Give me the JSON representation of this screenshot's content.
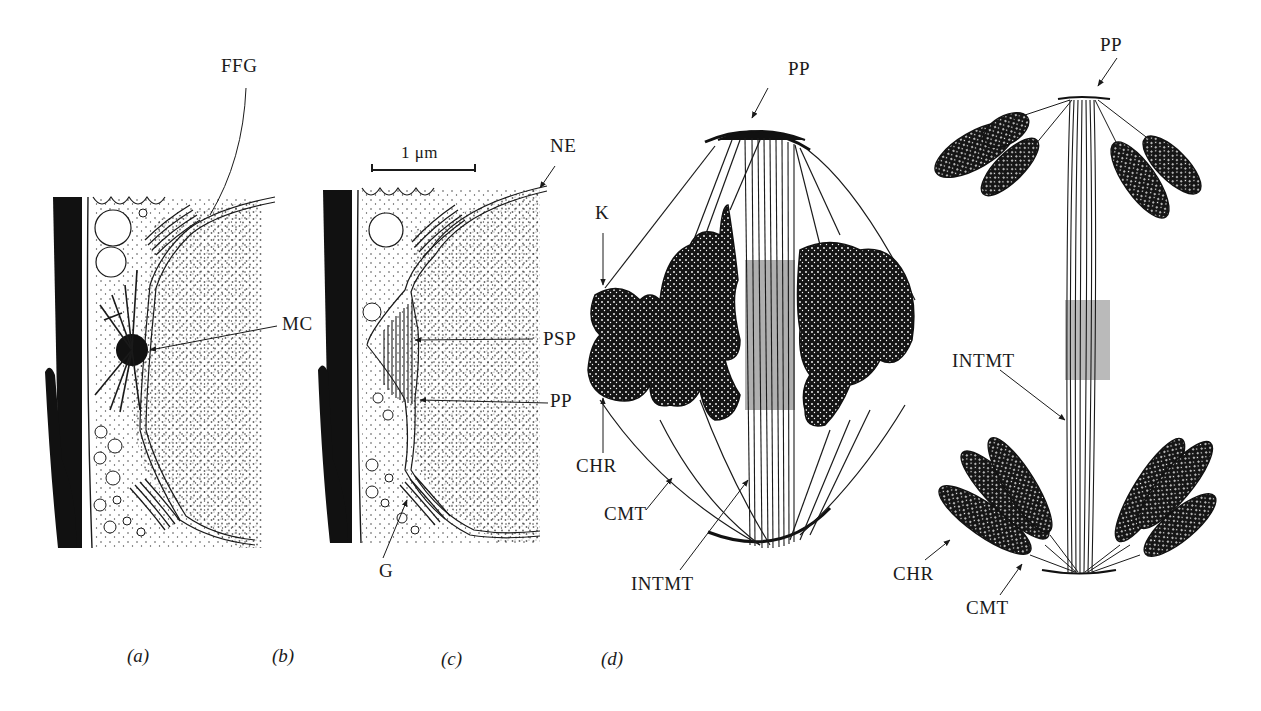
{
  "figure": {
    "panels": [
      {
        "id": "a",
        "caption": "(a)",
        "labels": {
          "ffg": "FFG",
          "mc": "MC"
        }
      },
      {
        "id": "b",
        "caption": "(b)",
        "scale_bar": "1 μm",
        "labels": {
          "ne": "NE",
          "psp": "PSP",
          "pp": "PP",
          "g": "G"
        }
      },
      {
        "id": "c",
        "caption": "(c)",
        "labels": {
          "pp": "PP",
          "k": "K",
          "chr": "CHR",
          "cmt": "CMT",
          "intmt": "INTMT"
        }
      },
      {
        "id": "d",
        "caption": "(d)",
        "labels": {
          "pp": "PP",
          "intmt": "INTMT",
          "chr": "CHR",
          "cmt": "CMT"
        }
      }
    ]
  },
  "colors": {
    "ink": "#1a1a1a",
    "background": "#ffffff"
  }
}
